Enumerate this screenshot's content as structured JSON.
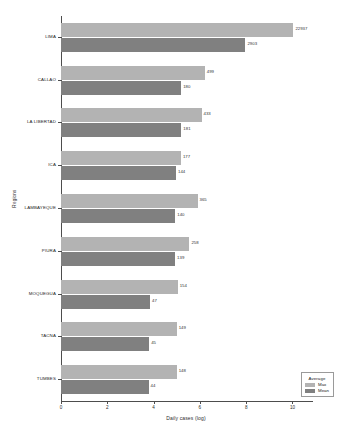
{
  "chart_data": {
    "type": "bar",
    "orientation": "horizontal",
    "title": "",
    "xlabel": "Daily cases (log)",
    "ylabel": "Regions",
    "xlim": [
      0,
      10.8
    ],
    "xticks": [
      0,
      2,
      4,
      6,
      8,
      10
    ],
    "xtick_labels": [
      "0",
      "2",
      "4",
      "6",
      "8",
      "10"
    ],
    "scale": "log",
    "grid": false,
    "categories": [
      "LIMA",
      "CALLAO",
      "LA LIBERTAD",
      "ICA",
      "LAMBAYEQUE",
      "PIURA",
      "MOQUEGUA",
      "TACNA",
      "TUMBES"
    ],
    "series": [
      {
        "name": "Max",
        "color": "#b3b3b3",
        "values": [
          22937,
          499,
          433,
          177,
          365,
          258,
          154,
          149,
          148
        ],
        "log_values": [
          10.04,
          6.21,
          6.07,
          5.18,
          5.9,
          5.55,
          5.04,
          5.0,
          5.0
        ]
      },
      {
        "name": "Mean",
        "color": "#808080",
        "values": [
          2903,
          180,
          181,
          144,
          140,
          139,
          47,
          45,
          44
        ],
        "log_values": [
          7.97,
          5.19,
          5.2,
          4.97,
          4.94,
          4.93,
          3.85,
          3.81,
          3.78
        ]
      }
    ],
    "legend": {
      "title": "Average",
      "position": "lower-right",
      "entries": [
        {
          "label": "Max",
          "color": "#b3b3b3"
        },
        {
          "label": "Mean",
          "color": "#808080"
        }
      ]
    }
  }
}
